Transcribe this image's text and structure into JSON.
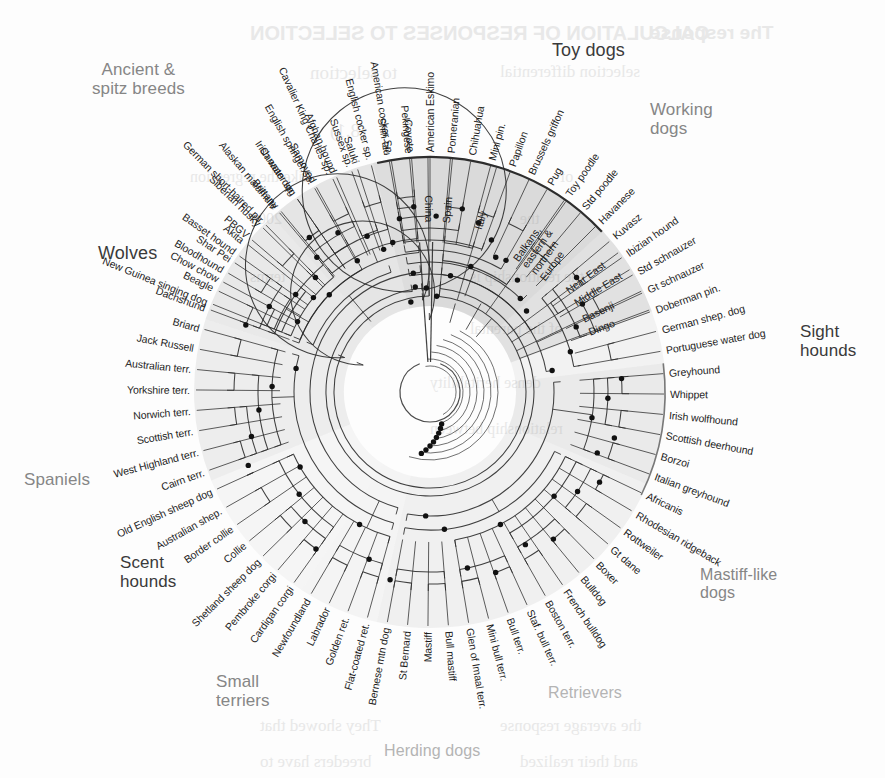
{
  "figure": {
    "type": "radial-dendrogram",
    "center": {
      "x": 430,
      "y": 392
    },
    "background_color": "#fdfdfd",
    "line_color": "#2b2b2b",
    "node_dot_color": "#111111"
  },
  "group_labels": [
    {
      "name": "ancient-spitz-breeds",
      "line1": "Ancient &",
      "line2": "spitz  breeds",
      "x": 92,
      "y": 60,
      "size": 17,
      "tone": "mid",
      "align": "center"
    },
    {
      "name": "toy-dogs",
      "line1": "Toy dogs",
      "line2": "",
      "x": 552,
      "y": 40,
      "size": 18,
      "tone": "dark",
      "align": "left"
    },
    {
      "name": "working-dogs",
      "line1": "Working",
      "line2": "dogs",
      "x": 650,
      "y": 100,
      "size": 17,
      "tone": "mid",
      "align": "left"
    },
    {
      "name": "sight-hounds",
      "line1": "Sight",
      "line2": "hounds",
      "x": 800,
      "y": 322,
      "size": 17,
      "tone": "dark",
      "align": "left"
    },
    {
      "name": "mastiff-like-dogs",
      "line1": "Mastiff-like",
      "line2": "dogs",
      "x": 700,
      "y": 566,
      "size": 16,
      "tone": "mid",
      "align": "left"
    },
    {
      "name": "retrievers",
      "line1": "Retrievers",
      "line2": "",
      "x": 548,
      "y": 684,
      "size": 16,
      "tone": "light",
      "align": "left"
    },
    {
      "name": "herding-dogs",
      "line1": "Herding dogs",
      "line2": "",
      "x": 384,
      "y": 742,
      "size": 16,
      "tone": "light",
      "align": "left"
    },
    {
      "name": "small-terriers",
      "line1": "Small",
      "line2": "terriers",
      "x": 216,
      "y": 672,
      "size": 17,
      "tone": "mid",
      "align": "left"
    },
    {
      "name": "scent-hounds",
      "line1": "Scent",
      "line2": "hounds",
      "x": 120,
      "y": 553,
      "size": 17,
      "tone": "dark",
      "align": "left"
    },
    {
      "name": "spaniels",
      "line1": "Spaniels",
      "line2": "",
      "x": 24,
      "y": 470,
      "size": 17,
      "tone": "mid",
      "align": "left"
    },
    {
      "name": "wolves",
      "line1": "Wolves",
      "line2": "",
      "x": 98,
      "y": 243,
      "size": 18,
      "tone": "dark",
      "align": "left"
    }
  ],
  "tips": [
    {
      "label": "New Guinea singing dog",
      "angle": -68
    },
    {
      "label": "Chow chow",
      "angle": -62
    },
    {
      "label": "Shar Pei",
      "angle": -56.5
    },
    {
      "label": "Akita",
      "angle": -51
    },
    {
      "label": "Siberian husky",
      "angle": -45.5
    },
    {
      "label": "Alaskan malamute",
      "angle": -40
    },
    {
      "label": "Canaan dog",
      "angle": -34.5
    },
    {
      "label": "Samoyed",
      "angle": -29
    },
    {
      "label": "Afghan hound",
      "angle": -23.5
    },
    {
      "label": "Saluki",
      "angle": -18
    },
    {
      "label": "Shih-tzu",
      "angle": -10
    },
    {
      "label": "Pekingese",
      "angle": -5
    },
    {
      "label": "American Eskimo",
      "angle": 0
    },
    {
      "label": "Pomeranian",
      "angle": 5
    },
    {
      "label": "Chihuahua",
      "angle": 10
    },
    {
      "label": "Mini pin.",
      "angle": 15
    },
    {
      "label": "Papillon",
      "angle": 20
    },
    {
      "label": "Brussels griffon",
      "angle": 25
    },
    {
      "label": "Pug",
      "angle": 30
    },
    {
      "label": "Toy poodle",
      "angle": 35
    },
    {
      "label": "Std poodle",
      "angle": 40
    },
    {
      "label": "Havanese",
      "angle": 45
    },
    {
      "label": "Kuvasz",
      "angle": 50
    },
    {
      "label": "Ibizian hound",
      "angle": 55
    },
    {
      "label": "Std schnauzer",
      "angle": 60
    },
    {
      "label": "Gt schnauzer",
      "angle": 65
    },
    {
      "label": "Doberman pin.",
      "angle": 70
    },
    {
      "label": "German shep. dog",
      "angle": 75
    },
    {
      "label": "Portuguese water dog",
      "angle": 80
    },
    {
      "label": "Greyhound",
      "angle": 85.5
    },
    {
      "label": "Whippet",
      "angle": 90.5
    },
    {
      "label": "Irish wolfhound",
      "angle": 95.5
    },
    {
      "label": "Scottish deerhound",
      "angle": 100.5
    },
    {
      "label": "Borzoi",
      "angle": 105.5
    },
    {
      "label": "Italian greyhound",
      "angle": 110.5
    },
    {
      "label": "Africanis",
      "angle": 115.5
    },
    {
      "label": "Rhodesian ridgeback",
      "angle": 120.5
    },
    {
      "label": "Rottweiler",
      "angle": 125.5
    },
    {
      "label": "Gt dane",
      "angle": 130.5
    },
    {
      "label": "Boxer",
      "angle": 135.5
    },
    {
      "label": "Bulldog",
      "angle": 140.5
    },
    {
      "label": "French bulldog",
      "angle": 145.5
    },
    {
      "label": "Boston terr.",
      "angle": 150.5
    },
    {
      "label": "Staf. bull terr.",
      "angle": 155.5
    },
    {
      "label": "Bull terr.",
      "angle": 160.5
    },
    {
      "label": "Mini bull terr.",
      "angle": 165.5
    },
    {
      "label": "Glen of Imaal terr.",
      "angle": 170.5
    },
    {
      "label": "Bull mastiff",
      "angle": 175.5
    },
    {
      "label": "Mastiff",
      "angle": 180.5
    },
    {
      "label": "St Bernard",
      "angle": 185.5
    },
    {
      "label": "Bernese mtn dog",
      "angle": 190.5
    },
    {
      "label": "Flat-coated ret.",
      "angle": 195.5
    },
    {
      "label": "Golden ret.",
      "angle": 200.5
    },
    {
      "label": "Labrador",
      "angle": 205.5
    },
    {
      "label": "Newfoundland",
      "angle": 210.5
    },
    {
      "label": "Cardigan corgi",
      "angle": 215.5
    },
    {
      "label": "Pembroke corgi",
      "angle": 220.5
    },
    {
      "label": "Shetland sheep dog",
      "angle": 225.5
    },
    {
      "label": "Collie",
      "angle": 230.5
    },
    {
      "label": "Border collie",
      "angle": 235.5
    },
    {
      "label": "Australian shep.",
      "angle": 240.5
    },
    {
      "label": "Old English sheep dog",
      "angle": 245.5
    },
    {
      "label": "Cairn terr.",
      "angle": 250.5
    },
    {
      "label": "West Highland terr.",
      "angle": 255.5
    },
    {
      "label": "Scottish terr.",
      "angle": 260.5
    },
    {
      "label": "Norwich terr.",
      "angle": 265.5
    },
    {
      "label": "Yorkshire terr.",
      "angle": 270.5
    },
    {
      "label": "Australian terr.",
      "angle": 275.5
    },
    {
      "label": "Jack Russell",
      "angle": 280.5
    },
    {
      "label": "Briard",
      "angle": 285.5
    },
    {
      "label": "Dachshund",
      "angle": 290.5
    },
    {
      "label": "Beagle",
      "angle": 295.5
    },
    {
      "label": "Bloodhound",
      "angle": 300.5
    },
    {
      "label": "Basset hound",
      "angle": 305.5
    },
    {
      "label": "PBGV",
      "angle": 310.5
    },
    {
      "label": "German short-haired ptr",
      "angle": 315.5
    },
    {
      "label": "Brittany",
      "angle": 320.5
    },
    {
      "label": "Irish water sp.",
      "angle": 325.5
    },
    {
      "label": "English springer sp.",
      "angle": 330.5
    },
    {
      "label": "Cavalier King Charles sp.",
      "angle": 335.5
    },
    {
      "label": "Sussex sp.",
      "angle": 340.5
    },
    {
      "label": "English cocker sp.",
      "angle": 345.5
    },
    {
      "label": "American cocker Sp.",
      "angle": 350.5
    },
    {
      "label": "Coyote",
      "angle": 355.5
    },
    {
      "label": "China",
      "angle": 359.5
    },
    {
      "label": "Spain",
      "angle": 5.5
    },
    {
      "label": "Italy",
      "angle": 16.5
    },
    {
      "label": "Balkans,\neastern &\nnorthern\nEurope",
      "angle": 35.5
    },
    {
      "label": "Near East",
      "angle": 53.5
    },
    {
      "label": "Middle East",
      "angle": 58.5
    },
    {
      "label": "Basenji",
      "angle": 64.5
    },
    {
      "label": "Dingo",
      "angle": 69.5
    }
  ],
  "wolf_tips": [
    "China",
    "Spain",
    "Italy",
    "Balkans, eastern & northern Europe",
    "Near East",
    "Middle East"
  ],
  "ghost_text": [
    {
      "text": "CALCULATION OF RESPONSES TO SELECTION",
      "x": 250,
      "y": 22,
      "size": 20,
      "weight": "700",
      "serif": false
    },
    {
      "text": "The response",
      "x": 650,
      "y": 22,
      "size": 19,
      "weight": "700",
      "serif": false
    },
    {
      "text": "to selection",
      "x": 310,
      "y": 62,
      "size": 19,
      "weight": "400",
      "serif": true
    },
    {
      "text": "selection differential",
      "x": 500,
      "y": 62,
      "size": 17,
      "weight": "400",
      "serif": true
    },
    {
      "text": "(8.1)",
      "x": 330,
      "y": 120,
      "size": 19,
      "weight": "400",
      "serif": true
    },
    {
      "text": "Like the regression",
      "x": 190,
      "y": 168,
      "size": 16,
      "weight": "400",
      "serif": true
    },
    {
      "text": "of",
      "x": 560,
      "y": 168,
      "size": 16,
      "weight": "400",
      "serif": true
    },
    {
      "text": "2008",
      "x": 250,
      "y": 210,
      "size": 16,
      "weight": "400",
      "serif": true
    },
    {
      "text": "the",
      "x": 520,
      "y": 210,
      "size": 16,
      "weight": "400",
      "serif": true
    },
    {
      "text": "terms",
      "x": 250,
      "y": 268,
      "size": 16,
      "weight": "400",
      "serif": true
    },
    {
      "text": "the relationship is",
      "x": 470,
      "y": 268,
      "size": 16,
      "weight": "400",
      "serif": true
    },
    {
      "text": "of the parental",
      "x": 470,
      "y": 320,
      "size": 16,
      "weight": "400",
      "serif": true
    },
    {
      "text": "dense heritability",
      "x": 430,
      "y": 374,
      "size": 16,
      "weight": "400",
      "serif": true
    },
    {
      "text": "relationship between",
      "x": 430,
      "y": 420,
      "size": 16,
      "weight": "400",
      "serif": true
    },
    {
      "text": "They showed that",
      "x": 260,
      "y": 716,
      "size": 17,
      "weight": "400",
      "serif": true
    },
    {
      "text": "the average response",
      "x": 500,
      "y": 716,
      "size": 17,
      "weight": "400",
      "serif": true
    },
    {
      "text": "breeders have to",
      "x": 260,
      "y": 752,
      "size": 17,
      "weight": "400",
      "serif": true
    },
    {
      "text": "and their realized",
      "x": 520,
      "y": 752,
      "size": 17,
      "weight": "400",
      "serif": true
    }
  ],
  "chart_data": {
    "type": "tree",
    "layout": "radial dendrogram, root at centre, tips on circumference",
    "n_tips": 91,
    "groups": [
      {
        "name": "Wolves",
        "tips": [
          "China",
          "Spain",
          "Italy",
          "Balkans, eastern & northern Europe",
          "Near East",
          "Middle East"
        ]
      },
      {
        "name": "Ancient & spitz breeds",
        "tips": [
          "Basenji",
          "Dingo",
          "New Guinea singing dog",
          "Chow chow",
          "Shar Pei",
          "Akita",
          "Siberian husky",
          "Alaskan malamute",
          "Canaan dog",
          "Samoyed",
          "Afghan hound",
          "Saluki"
        ]
      },
      {
        "name": "Toy dogs",
        "tips": [
          "Shih-tzu",
          "Pekingese",
          "American Eskimo",
          "Pomeranian",
          "Chihuahua",
          "Mini pin.",
          "Papillon",
          "Brussels griffon",
          "Pug",
          "Toy poodle",
          "Std poodle",
          "Havanese"
        ]
      },
      {
        "name": "Working dogs",
        "tips": [
          "Kuvasz",
          "Ibizian hound",
          "Std schnauzer",
          "Gt schnauzer",
          "Doberman pin.",
          "German shep. dog",
          "Portuguese water dog"
        ]
      },
      {
        "name": "Sight hounds",
        "tips": [
          "Greyhound",
          "Whippet",
          "Irish wolfhound",
          "Scottish deerhound",
          "Borzoi",
          "Italian greyhound"
        ]
      },
      {
        "name": "Mastiff-like dogs",
        "tips": [
          "Africanis",
          "Rhodesian ridgeback",
          "Rottweiler",
          "Gt dane",
          "Boxer",
          "Bulldog",
          "French bulldog",
          "Boston terr.",
          "Staf. bull terr.",
          "Bull terr.",
          "Mini bull terr.",
          "Glen of Imaal terr.",
          "Bull mastiff",
          "Mastiff",
          "St Bernard",
          "Bernese mtn dog"
        ]
      },
      {
        "name": "Retrievers",
        "tips": [
          "Flat-coated ret.",
          "Golden ret.",
          "Labrador",
          "Newfoundland"
        ]
      },
      {
        "name": "Herding dogs",
        "tips": [
          "Cardigan corgi",
          "Pembroke corgi",
          "Shetland sheep dog",
          "Collie",
          "Border collie",
          "Australian shep.",
          "Old English sheep dog"
        ]
      },
      {
        "name": "Small terriers",
        "tips": [
          "Cairn terr.",
          "West Highland terr.",
          "Scottish terr.",
          "Norwich terr.",
          "Yorkshire terr.",
          "Australian terr.",
          "Jack Russell",
          "Briard"
        ]
      },
      {
        "name": "Scent hounds",
        "tips": [
          "Dachshund",
          "Beagle",
          "Bloodhound",
          "Basset hound",
          "PBGV",
          "German short-haired ptr"
        ]
      },
      {
        "name": "Spaniels",
        "tips": [
          "Brittany",
          "Irish water sp.",
          "English springer sp.",
          "Cavalier King Charles sp.",
          "Sussex sp.",
          "English cocker sp.",
          "American cocker Sp."
        ]
      },
      {
        "name": "Outgroup",
        "tips": [
          "Coyote"
        ]
      }
    ]
  }
}
